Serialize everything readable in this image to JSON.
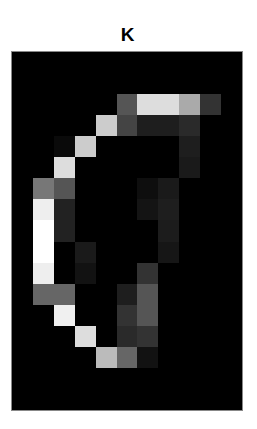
{
  "title": "K",
  "image": {
    "rows": 17,
    "cols": 11,
    "pixels": [
      [
        0,
        0,
        0,
        0,
        0,
        0,
        0,
        0,
        0,
        0,
        0
      ],
      [
        0,
        0,
        0,
        0,
        0,
        0,
        0,
        0,
        0,
        0,
        0
      ],
      [
        0,
        0,
        0,
        0,
        0,
        85,
        221,
        221,
        170,
        51,
        0
      ],
      [
        0,
        0,
        0,
        0,
        204,
        68,
        30,
        30,
        42,
        0,
        0
      ],
      [
        0,
        0,
        10,
        204,
        0,
        0,
        0,
        0,
        30,
        0,
        0
      ],
      [
        0,
        0,
        221,
        0,
        0,
        0,
        0,
        0,
        26,
        0,
        0
      ],
      [
        0,
        119,
        85,
        0,
        0,
        0,
        14,
        26,
        0,
        0,
        0
      ],
      [
        0,
        238,
        34,
        0,
        0,
        0,
        20,
        30,
        0,
        0,
        0
      ],
      [
        0,
        255,
        34,
        0,
        0,
        0,
        0,
        28,
        0,
        0,
        0
      ],
      [
        0,
        255,
        0,
        26,
        0,
        0,
        0,
        22,
        0,
        0,
        0
      ],
      [
        0,
        238,
        0,
        18,
        0,
        0,
        51,
        0,
        0,
        0,
        0
      ],
      [
        0,
        102,
        102,
        0,
        0,
        30,
        85,
        0,
        0,
        0,
        0
      ],
      [
        0,
        0,
        240,
        0,
        0,
        51,
        85,
        0,
        0,
        0,
        0
      ],
      [
        0,
        0,
        0,
        221,
        0,
        42,
        51,
        0,
        0,
        0,
        0
      ],
      [
        0,
        0,
        0,
        0,
        187,
        102,
        18,
        0,
        0,
        0,
        0
      ],
      [
        0,
        0,
        0,
        0,
        0,
        0,
        0,
        0,
        0,
        0,
        0
      ],
      [
        0,
        0,
        0,
        0,
        0,
        0,
        0,
        0,
        0,
        0,
        0
      ]
    ]
  }
}
